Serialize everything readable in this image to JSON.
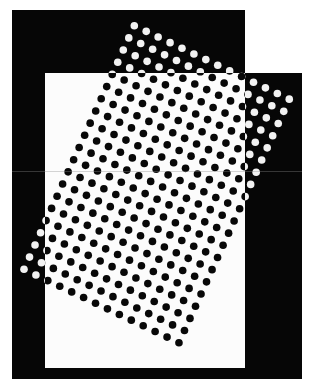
{
  "figure": {
    "width": 313,
    "height": 386,
    "colors": {
      "background": "#ffffff",
      "frame_black": "#060606",
      "window_white": "#fcfcfc",
      "dot_on_black": "#f2f2f2",
      "dot_on_white": "#080808",
      "scan_line": "#8c8c8c"
    },
    "frame": {
      "top_block": {
        "x": 12,
        "y": 10,
        "w": 233,
        "h": 63
      },
      "main_block": {
        "x": 12,
        "y": 73,
        "w": 290,
        "h": 306
      },
      "inner_window": {
        "x": 45,
        "y": 73,
        "w": 200,
        "h": 295
      }
    },
    "dot_lattice": {
      "description": "square grid of dots rotated about 25 degrees; black where over the white window, white where over the black frame",
      "origin": [
        134.3,
        25.7
      ],
      "col_step": [
        11.92,
        5.65
      ],
      "row_step": [
        -5.515,
        12.18
      ],
      "cols": 14,
      "rows": 21,
      "dot_radius": 3.8,
      "rotation_deg": 25.4,
      "spacing_px": 13.2
    },
    "scan_line": {
      "x1": 12,
      "x2": 302,
      "y": 171.5,
      "opacity": 0.45
    }
  }
}
